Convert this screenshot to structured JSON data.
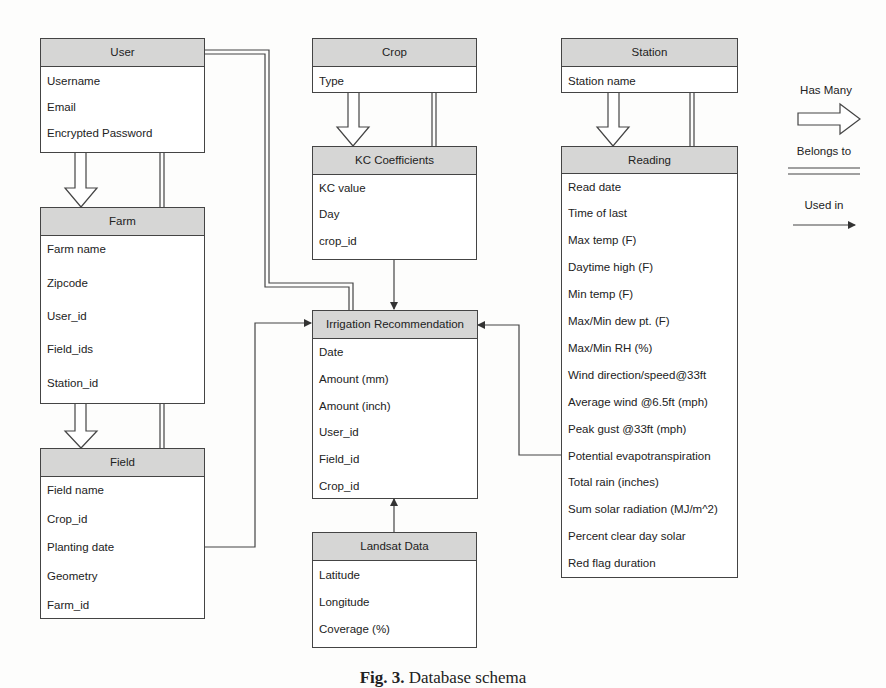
{
  "entities": {
    "user": {
      "title": "User",
      "fields": [
        "Username",
        "Email",
        "Encrypted Password"
      ]
    },
    "farm": {
      "title": "Farm",
      "fields": [
        "Farm name",
        "Zipcode",
        "User_id",
        "Field_ids",
        "Station_id"
      ]
    },
    "field": {
      "title": "Field",
      "fields": [
        "Field name",
        "Crop_id",
        "Planting date",
        "Geometry",
        "Farm_id"
      ]
    },
    "crop": {
      "title": "Crop",
      "fields": [
        "Type"
      ]
    },
    "kc": {
      "title": "KC Coefficients",
      "fields": [
        "KC value",
        "Day",
        "crop_id"
      ]
    },
    "irrigation": {
      "title": "Irrigation Recommendation",
      "fields": [
        "Date",
        "Amount (mm)",
        "Amount (inch)",
        "User_id",
        "Field_id",
        "Crop_id"
      ]
    },
    "landsat": {
      "title": "Landsat Data",
      "fields": [
        "Latitude",
        "Longitude",
        "Coverage (%)"
      ]
    },
    "station": {
      "title": "Station",
      "fields": [
        "Station name"
      ]
    },
    "reading": {
      "title": "Reading",
      "fields": [
        "Read date",
        "Time of last",
        "Max temp (F)",
        "Daytime high (F)",
        "Min temp (F)",
        "Max/Min dew pt. (F)",
        "Max/Min RH (%)",
        "Wind direction/speed@33ft",
        "Average wind @6.5ft (mph)",
        "Peak gust @33ft (mph)",
        "Potential evapotranspiration",
        "Total rain (inches)",
        "Sum solar radiation (MJ/m^2)",
        "Percent clear day solar",
        "Red flag duration"
      ]
    }
  },
  "relationships": [
    {
      "from": "User",
      "to": "Farm",
      "type": "Has Many"
    },
    {
      "from": "Farm",
      "to": "User",
      "type": "Belongs to"
    },
    {
      "from": "Farm",
      "to": "Field",
      "type": "Has Many"
    },
    {
      "from": "Field",
      "to": "Farm",
      "type": "Belongs to"
    },
    {
      "from": "Crop",
      "to": "KC Coefficients",
      "type": "Has Many"
    },
    {
      "from": "KC Coefficients",
      "to": "Crop",
      "type": "Belongs to"
    },
    {
      "from": "Station",
      "to": "Reading",
      "type": "Has Many"
    },
    {
      "from": "Reading",
      "to": "Station",
      "type": "Belongs to"
    },
    {
      "from": "Irrigation Recommendation",
      "to": "User",
      "type": "Belongs to"
    },
    {
      "from": "KC Coefficients",
      "to": "Irrigation Recommendation",
      "type": "Used in"
    },
    {
      "from": "Field",
      "to": "Irrigation Recommendation",
      "type": "Used in"
    },
    {
      "from": "Reading",
      "to": "Irrigation Recommendation",
      "type": "Used in"
    },
    {
      "from": "Landsat Data",
      "to": "Irrigation Recommendation",
      "type": "Used in"
    }
  ],
  "legend": {
    "has_many": "Has Many",
    "belongs_to": "Belongs to",
    "used_in": "Used in"
  },
  "caption": {
    "label": "Fig. 3.",
    "text": "Database schema"
  },
  "colors": {
    "header_fill": "#d6d6d5",
    "line": "#444444"
  }
}
